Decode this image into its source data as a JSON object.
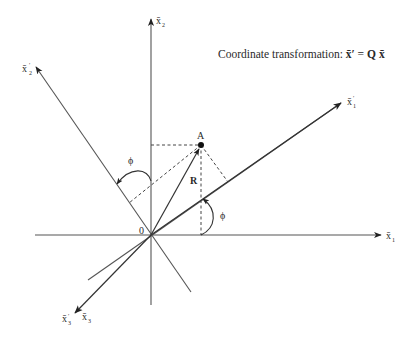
{
  "title": {
    "prefix": "Coordinate transformation: ",
    "lhs": "x̄′",
    "eq": " = ",
    "matrix": "Q",
    "rhs": "x̄"
  },
  "axes": {
    "x1": {
      "base": "x̄",
      "sub": "1",
      "prime": ""
    },
    "x2": {
      "base": "x̄",
      "sub": "2",
      "prime": ""
    },
    "x3": {
      "base": "x̄",
      "sub": "3",
      "prime": ""
    },
    "x1p": {
      "base": "x̄",
      "sub": "1",
      "prime": "′"
    },
    "x2p": {
      "base": "x̄",
      "sub": "2",
      "prime": "′"
    },
    "x3p": {
      "base": "x̄",
      "sub": "3",
      "prime": "′"
    }
  },
  "points": {
    "origin": {
      "label": "0"
    },
    "A": {
      "label": "A"
    }
  },
  "vectors": {
    "R": {
      "label": "R"
    }
  },
  "angles": {
    "phi_x1": {
      "label": "ϕ"
    },
    "phi_x2": {
      "label": "ϕ"
    }
  },
  "colors": {
    "line": "#555555",
    "text": "#2a2a2a",
    "background": "#ffffff"
  }
}
